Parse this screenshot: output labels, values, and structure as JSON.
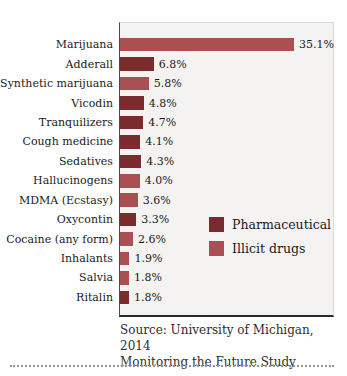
{
  "chart_data": {
    "type": "bar",
    "orientation": "horizontal",
    "title": "",
    "categories": [
      "Marijuana",
      "Adderall",
      "Synthetic marijuana",
      "Vicodin",
      "Tranquilizers",
      "Cough medicine",
      "Sedatives",
      "Hallucinogens",
      "MDMA (Ecstasy)",
      "Oxycontin",
      "Cocaine (any form)",
      "Inhalants",
      "Salvia",
      "Ritalin"
    ],
    "values": [
      35.1,
      6.8,
      5.8,
      4.8,
      4.7,
      4.1,
      4.3,
      4.0,
      3.6,
      3.3,
      2.6,
      1.9,
      1.8,
      1.8
    ],
    "value_labels": [
      "35.1%",
      "6.8%",
      "5.8%",
      "4.8%",
      "4.7%",
      "4.1%",
      "4.3%",
      "4.0%",
      "3.6%",
      "3.3%",
      "2.6%",
      "1.9%",
      "1.8%",
      "1.8%"
    ],
    "groups": [
      "illicit",
      "pharmaceutical",
      "illicit",
      "pharmaceutical",
      "pharmaceutical",
      "pharmaceutical",
      "pharmaceutical",
      "illicit",
      "illicit",
      "pharmaceutical",
      "illicit",
      "illicit",
      "illicit",
      "pharmaceutical"
    ],
    "colors": {
      "pharmaceutical": "#7a2b2e",
      "illicit": "#a85052",
      "plot_background": "#f4f3f1"
    },
    "legend": [
      {
        "key": "pharmaceutical",
        "label": "Pharmaceutical"
      },
      {
        "key": "illicit",
        "label": "Illicit drugs"
      }
    ],
    "legend_position": "inside-right",
    "xlim": [
      0,
      43.4
    ],
    "grid": false,
    "xlabel": "",
    "ylabel": ""
  },
  "source": {
    "line1": "Source: University of Michigan, 2014",
    "line2": "Monitoring the Future Study"
  }
}
